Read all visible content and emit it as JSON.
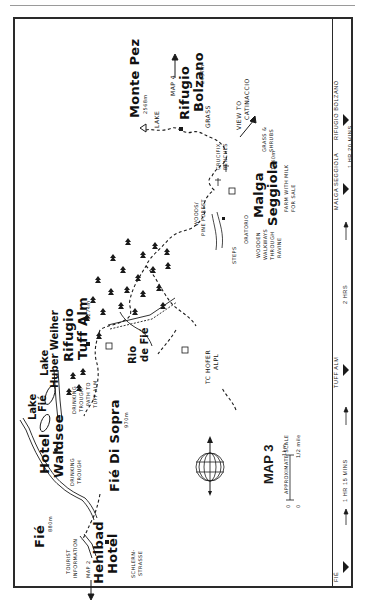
{
  "map": {
    "title": "MAP 3",
    "scale": {
      "label": "APPROXIMATE SCALE",
      "zero": "0",
      "zero2": "0",
      "km": "1km",
      "mile": "1/2 mile"
    },
    "places": {
      "monte_pez": "Monte Pez",
      "monte_pez_alt": "2568m",
      "rifugio_bolzano_1": "Rifugio",
      "rifugio_bolzano_2": "Bolzano",
      "rifugio_bolzano_alt": "2457m",
      "malga_seggiola_1": "Malga",
      "malga_seggiola_2": "Seggiola",
      "malga_seggiola_alt": "1940m",
      "rifugio_tuff_alm_1": "Rifugio",
      "rifugio_tuff_alm_2": "Tuff Alm",
      "rifugio_tuff_alm_alt": "1274m",
      "lake_huber_weiher_1": "Lake",
      "lake_huber_weiher_2": "Huber Weiher",
      "lake_fie_1": "Lake",
      "lake_fie_2": "Fié",
      "hotel_waldsee_1": "Hotel",
      "hotel_waldsee_2": "Waldsee",
      "fie_di_sopra": "Fié Di Sopra",
      "fie_di_sopra_alt": "970m",
      "fie": "Fié",
      "fie_alt": "880m",
      "hehlbad_1": "Hehlbad",
      "hehlbad_2": "Hotel",
      "rio_de_fie_1": "Rio",
      "rio_de_fie_2": "de Fié"
    },
    "notes": {
      "map4": "MAP 4",
      "lake": "LAKE",
      "grass": "GRASS",
      "view_1": "VIEW TO",
      "view_2": "CATINACCIO",
      "crucifix_1": "CRUCIFIX",
      "crucifix_2": "BENCHES",
      "grass_shrubs_1": "GRASS &",
      "grass_shrubs_2": "SHRUBS",
      "farm_1": "FARM WITH MILK",
      "farm_2": "FOR SALE",
      "oratorio": "ORATORIO",
      "wooden_1": "WOODEN",
      "wooden_2": "WALKWAYS",
      "wooden_3": "THROUGH",
      "wooden_4": "RAVINE",
      "steps": "STEPS",
      "woods_1": "WOODS/",
      "woods_2": "PINE FOREST",
      "tc_hofer_1": "TC HOFER",
      "tc_hofer_2": "ALPL",
      "drinking_1a": "DRINKING",
      "drinking_1b": "TROUGH",
      "drinking_2a": "DRINKING",
      "drinking_2b": "TROUGH",
      "path_1": "PATH TO",
      "path_2": "TUFF ALM",
      "tourist_1": "TOURIST",
      "tourist_2": "INFORMATION",
      "map2": "MAP 2",
      "schlern_1": "SCHLERN-",
      "schlern_2": "STRASSE",
      "trail_1": "1",
      "trail_2": "2",
      "trail_3": "3"
    },
    "timeline": {
      "stops": [
        "FIÉ",
        "TUFF ALM",
        "MALGA SEGGIOLA",
        "RIFUGIO BOLZANO"
      ],
      "legs": [
        "1 HR 15 MINS",
        "2 HRS",
        "1 HR 20 MINS"
      ]
    },
    "colors": {
      "ink": "#1a1a1a",
      "paper": "#ffffff",
      "frame": "#2a2a2a"
    }
  }
}
